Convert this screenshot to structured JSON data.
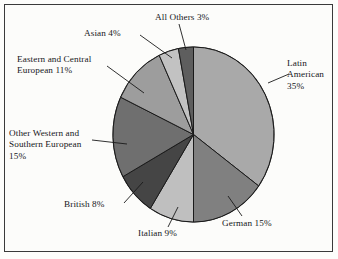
{
  "chart_data": {
    "type": "pie",
    "title": "",
    "subtitle": "",
    "xlabel": "",
    "ylabel": "",
    "legend_position": "none",
    "grid": false,
    "units": "percent",
    "start_angle_deg": 0,
    "direction": "clockwise",
    "categories": [
      "Latin American",
      "German",
      "Italian",
      "British",
      "Other Western and Southern European",
      "Eastern and Central European",
      "Asian",
      "All Others"
    ],
    "values": [
      35,
      15,
      9,
      8,
      15,
      11,
      4,
      3
    ],
    "labels": [
      "Latin\nAmerican\n35%",
      "German 15%",
      "Italian 9%",
      "British 8%",
      "Other Western and\nSouthern European\n15%",
      "Eastern and Central\nEuropean 11%",
      "Asian 4%",
      "All Others 3%"
    ],
    "slice_colors": [
      "#a9a9a9",
      "#808080",
      "#bfbfbf",
      "#454545",
      "#6f6f6f",
      "#9d9d9d",
      "#c2c2c2",
      "#5e5e5e"
    ],
    "slice_border_color": "#1a1a1a",
    "frame_color": "#3a3a3a",
    "background_color": "#fcfcfa",
    "text_color": "#17171a"
  },
  "labels": {
    "latin_american": "Latin\nAmerican\n35%",
    "german": "German 15%",
    "italian": "Italian 9%",
    "british": "British 8%",
    "other_western_southern": "Other Western and\nSouthern European\n15%",
    "eastern_central": "Eastern and Central\nEuropean 11%",
    "asian": "Asian 4%",
    "all_others": "All Others 3%"
  }
}
